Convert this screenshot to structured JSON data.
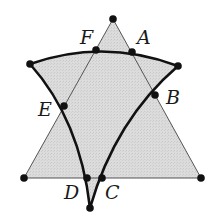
{
  "diagram": {
    "type": "geometry",
    "colors": {
      "fill": "#d9d9d9",
      "thin_line": "#555555",
      "thick_line": "#111111",
      "point": "#111111"
    },
    "triangle": {
      "vertices": {
        "top": [
          113,
          19
        ],
        "bottom_left": [
          24,
          178
        ],
        "bottom_right": [
          201,
          178
        ]
      }
    },
    "curved_shape": {
      "left_end": [
        30,
        64
      ],
      "right_end": [
        178,
        66
      ],
      "bottom": [
        90,
        208
      ]
    },
    "points": [
      {
        "name": "A",
        "pos": [
          132,
          52
        ],
        "label_pos": [
          137,
          44
        ]
      },
      {
        "name": "B",
        "pos": [
          155,
          95
        ],
        "label_pos": [
          166,
          104
        ]
      },
      {
        "name": "C",
        "pos": [
          102,
          178
        ],
        "label_pos": [
          105,
          199
        ]
      },
      {
        "name": "D",
        "pos": [
          87,
          178
        ],
        "label_pos": [
          64,
          199
        ]
      },
      {
        "name": "E",
        "pos": [
          64,
          106
        ],
        "label_pos": [
          38,
          116
        ]
      },
      {
        "name": "F",
        "pos": [
          96,
          50
        ],
        "label_pos": [
          80,
          44
        ]
      }
    ]
  }
}
